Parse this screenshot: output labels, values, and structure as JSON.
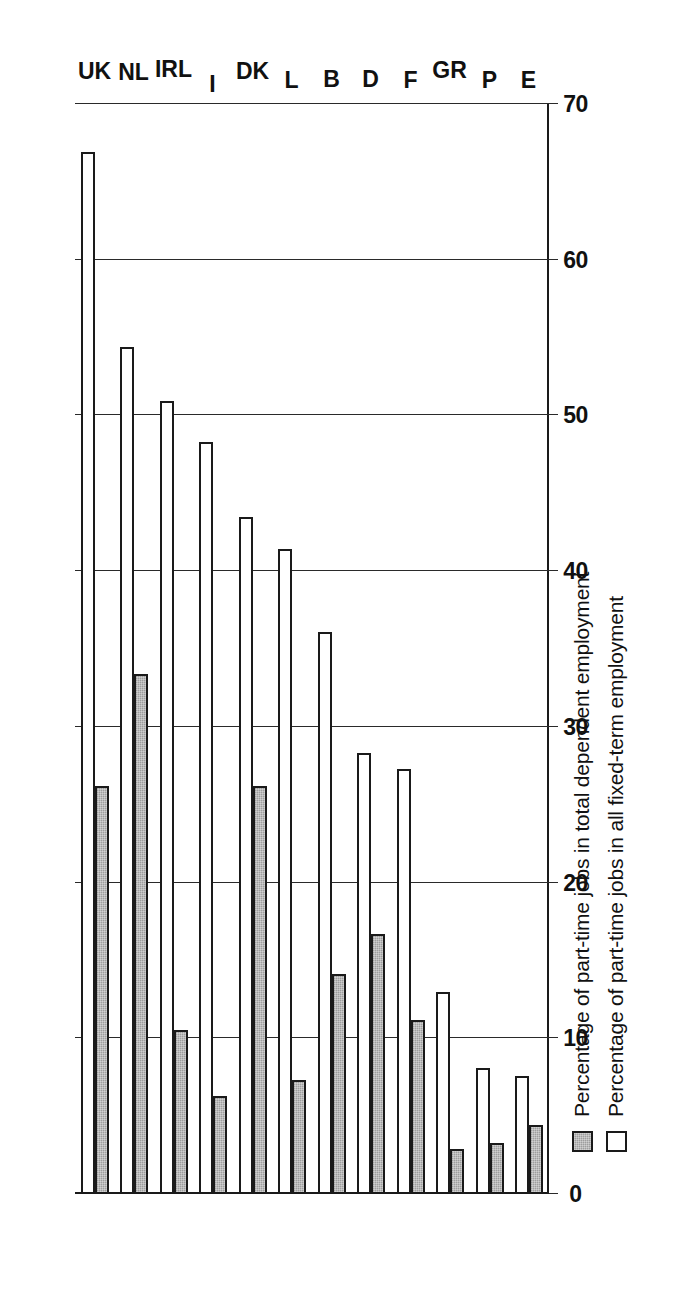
{
  "chart_data": {
    "type": "bar",
    "orientation": "horizontal-rotated",
    "title": "",
    "subtitle": "",
    "xlabel": "",
    "ylabel": "",
    "grid": true,
    "axis_range": [
      0,
      70
    ],
    "axis_ticks": [
      "0",
      "10",
      "20",
      "30",
      "40",
      "50",
      "60",
      "70"
    ],
    "axis_tick_values": [
      0,
      10,
      20,
      30,
      40,
      50,
      60,
      70
    ],
    "legend_position": "bottom-left",
    "categories": [
      "E",
      "P",
      "GR",
      "F",
      "D",
      "B",
      "L",
      "DK",
      "I",
      "IRL",
      "NL",
      "UK"
    ],
    "series": [
      {
        "name": "Percentage of part-time jobs in total dependent employment",
        "swatch": "gray",
        "color": "#9d9d9d",
        "values": [
          4.4,
          3.3,
          2.9,
          11.2,
          16.7,
          14.1,
          7.3,
          26.2,
          6.3,
          10.5,
          33.4,
          26.2
        ]
      },
      {
        "name": "Percentage of part-time jobs in all fixed-term employment",
        "swatch": "white",
        "color": "#ffffff",
        "values": [
          7.6,
          8.1,
          13.0,
          27.3,
          28.3,
          36.1,
          41.4,
          43.5,
          48.3,
          50.9,
          54.4,
          66.9
        ]
      }
    ]
  },
  "legend": {
    "items": [
      {
        "label": "Percentage of part-time jobs in total dependent employment",
        "swatch": "gray"
      },
      {
        "label": "Percentage of part-time jobs in all fixed-term employment",
        "swatch": "white"
      }
    ]
  }
}
